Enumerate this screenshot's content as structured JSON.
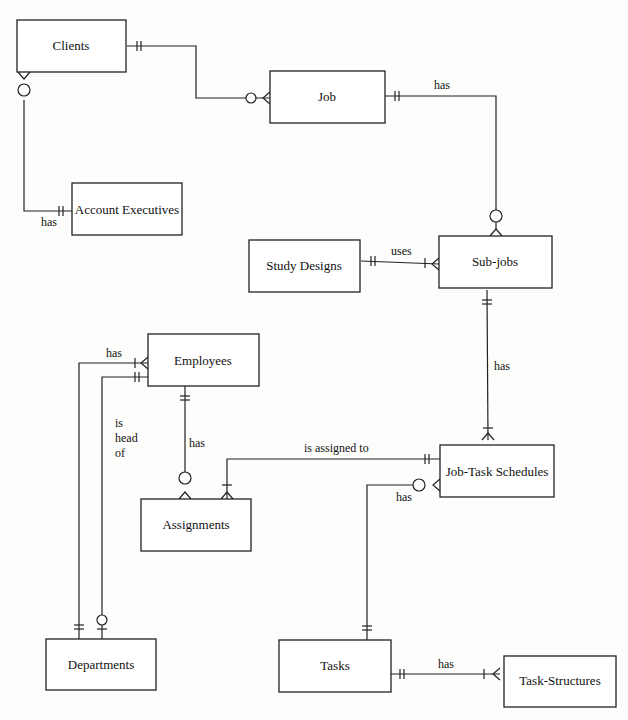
{
  "entities": {
    "clients": "Clients",
    "job": "Job",
    "account_executives": "Account Executives",
    "study_designs": "Study Designs",
    "sub_jobs": "Sub-jobs",
    "employees": "Employees",
    "assignments": "Assignments",
    "job_task_schedules": "Job-Task Schedules",
    "departments": "Departments",
    "tasks": "Tasks",
    "task_structures": "Task-Structures"
  },
  "relationships": {
    "clients_job": "",
    "clients_account_executives": "has",
    "job_sub_jobs": "has",
    "study_designs_sub_jobs": "uses",
    "sub_jobs_job_task_schedules": "has",
    "departments_employees": "has",
    "employee_head_l1": "is",
    "employee_head_l2": "head",
    "employee_head_l3": "of",
    "employees_assignments": "has",
    "assignments_job_task_schedules": "is assigned to",
    "tasks_job_task_schedules": "has",
    "tasks_task_structures": "has"
  }
}
